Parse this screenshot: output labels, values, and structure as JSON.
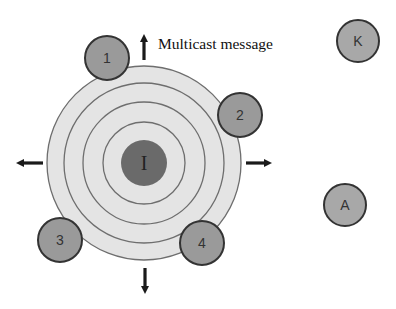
{
  "diagram": {
    "caption": "Multicast message",
    "colors": {
      "background": "#ffffff",
      "ring_fill": "#e4e4e4",
      "ring_stroke": "#6e6e6e",
      "source_fill": "#6a6a6a",
      "node_fill": "#9a9a9a",
      "outside_node_fill": "#a8a8a8",
      "node_stroke": "#333333",
      "arrow": "#1a1a1a"
    },
    "source": {
      "label": "I",
      "cx": 144,
      "cy": 163,
      "r": 23
    },
    "rings": [
      {
        "r": 97
      },
      {
        "r": 80
      },
      {
        "r": 61
      },
      {
        "r": 41
      }
    ],
    "members": [
      {
        "label": "1",
        "cx": 107,
        "cy": 58,
        "r": 22
      },
      {
        "label": "2",
        "cx": 240,
        "cy": 115,
        "r": 22
      },
      {
        "label": "3",
        "cx": 60,
        "cy": 240,
        "r": 22
      },
      {
        "label": "4",
        "cx": 202,
        "cy": 243,
        "r": 22
      }
    ],
    "outsiders": [
      {
        "label": "K",
        "cx": 358,
        "cy": 41,
        "r": 21
      },
      {
        "label": "A",
        "cx": 345,
        "cy": 205,
        "r": 21
      }
    ],
    "arrows": [
      {
        "direction": "up",
        "x1": 144,
        "y1": 60,
        "x2": 144,
        "y2": 38
      },
      {
        "direction": "down",
        "x1": 145,
        "y1": 268,
        "x2": 145,
        "y2": 290
      },
      {
        "direction": "left",
        "x1": 43,
        "y1": 163,
        "x2": 20,
        "y2": 163
      },
      {
        "direction": "right",
        "x1": 246,
        "y1": 163,
        "x2": 268,
        "y2": 163
      }
    ]
  }
}
